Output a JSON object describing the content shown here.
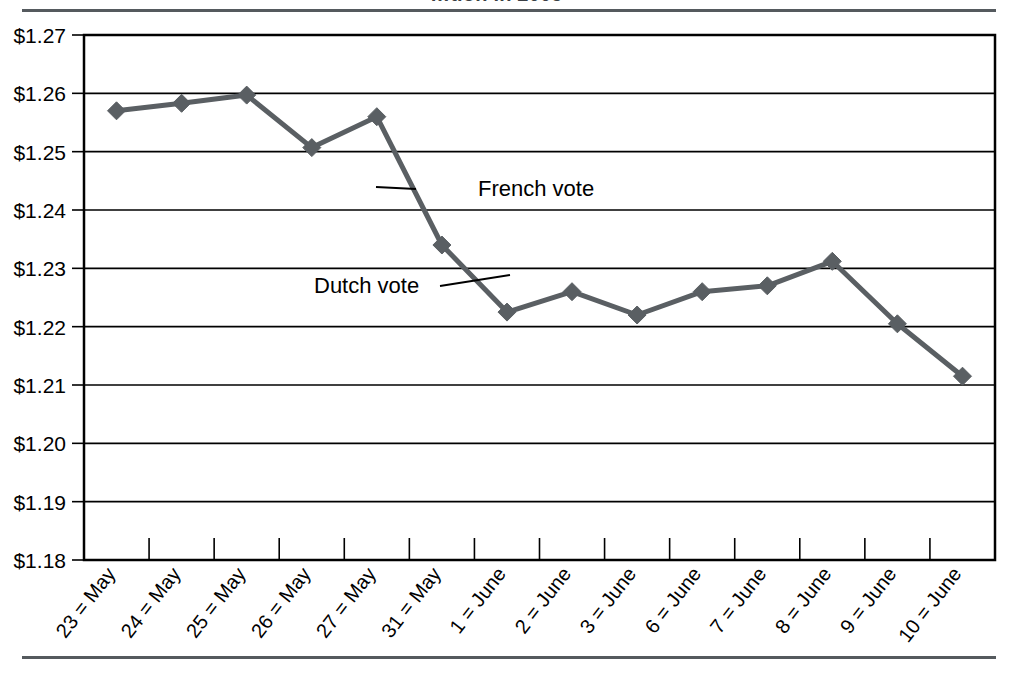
{
  "header": {
    "title_fragment": "…tion in 2005",
    "rule_color": "#555a5e"
  },
  "chart_data": {
    "type": "line",
    "title": "…tion in 2005",
    "xlabel": "",
    "ylabel": "",
    "categories": [
      "23 = May",
      "24 = May",
      "25 = May",
      "26 = May",
      "27 = May",
      "31 = May",
      "1 = June",
      "2 = June",
      "3 = June",
      "6 = June",
      "7 = June",
      "8 = June",
      "9 = June",
      "10 = June"
    ],
    "values": [
      1.257,
      1.2583,
      1.2597,
      1.2507,
      1.256,
      1.234,
      1.2225,
      1.226,
      1.222,
      1.226,
      1.227,
      1.2312,
      1.2205,
      1.2115
    ],
    "ylim": [
      1.18,
      1.27
    ],
    "ytick_step": 0.01,
    "ytick_labels": [
      "$1.27",
      "$1.26",
      "$1.25",
      "$1.24",
      "$1.23",
      "$1.22",
      "$1.21",
      "$1.20",
      "$1.19",
      "$1.18"
    ],
    "grid": true,
    "legend": "none",
    "series_color": "#5a5f63",
    "marker": "diamond",
    "annotations": [
      {
        "text": "French vote",
        "x_index": 5,
        "value": 1.243
      },
      {
        "text": "Dutch vote",
        "x_index": 6,
        "value": 1.227
      }
    ]
  },
  "axis": {
    "y_labels": [
      "$1.27",
      "$1.26",
      "$1.25",
      "$1.24",
      "$1.23",
      "$1.22",
      "$1.21",
      "$1.20",
      "$1.19",
      "$1.18"
    ],
    "x_labels": [
      "23 = May",
      "24 = May",
      "25 = May",
      "26 = May",
      "27 = May",
      "31 = May",
      "1 = June",
      "2 = June",
      "3 = June",
      "6 = June",
      "7 = June",
      "8 = June",
      "9 = June",
      "10 = June"
    ]
  },
  "annotations": {
    "french": "French vote",
    "dutch": "Dutch vote"
  }
}
